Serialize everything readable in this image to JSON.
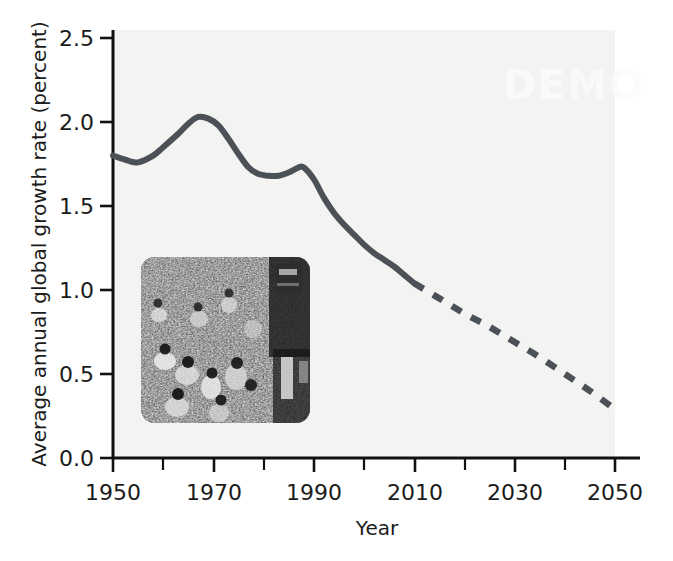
{
  "figure": {
    "background_color": "#ffffff",
    "plot_background_color": "#f3f3f2",
    "line_color": "#4c5057",
    "axis_color": "#111111",
    "watermark_text": "DEMO"
  },
  "inset": {
    "name": "crowd-photograph",
    "description": "Black and white photograph of a dense crowd of people walking in a street",
    "corner_radius_px": 14
  },
  "chart_data": {
    "type": "line",
    "title": "",
    "subtitle": "",
    "xlabel": "Year",
    "ylabel": "Average annual global growth rate (percent)",
    "xlim": [
      1950,
      2050
    ],
    "ylim": [
      0.0,
      2.5
    ],
    "grid": false,
    "legend": "none",
    "x_ticks": [
      1950,
      1960,
      1970,
      1980,
      1990,
      2000,
      2010,
      2020,
      2030,
      2040,
      2050
    ],
    "x_tick_labels": [
      "1950",
      "",
      "1970",
      "",
      "1990",
      "",
      "2010",
      "",
      "2030",
      "",
      "2050"
    ],
    "x_major_labels": [
      "1950",
      "1970",
      "1990",
      "2010",
      "2030",
      "2050"
    ],
    "y_ticks": [
      0.0,
      0.5,
      1.0,
      1.5,
      2.0,
      2.5
    ],
    "y_tick_labels": [
      "0.0",
      "0.5",
      "1.0",
      "1.5",
      "2.0",
      "2.5"
    ],
    "series": [
      {
        "name": "Historical (observed)",
        "style": "solid",
        "x": [
          1950,
          1953,
          1955,
          1958,
          1960,
          1963,
          1965,
          1967,
          1969,
          1971,
          1973,
          1975,
          1977,
          1979,
          1981,
          1983,
          1985,
          1987,
          1988,
          1990,
          1992,
          1994,
          1996,
          1998,
          2000,
          2002,
          2004,
          2006,
          2008,
          2010
        ],
        "y": [
          1.8,
          1.77,
          1.76,
          1.8,
          1.85,
          1.93,
          1.99,
          2.03,
          2.02,
          1.98,
          1.9,
          1.81,
          1.73,
          1.69,
          1.68,
          1.68,
          1.7,
          1.73,
          1.73,
          1.66,
          1.55,
          1.46,
          1.39,
          1.33,
          1.27,
          1.22,
          1.18,
          1.14,
          1.09,
          1.04
        ]
      },
      {
        "name": "Projected",
        "style": "dashed",
        "x": [
          2010,
          2015,
          2020,
          2025,
          2030,
          2035,
          2040,
          2045,
          2050
        ],
        "y": [
          1.04,
          0.95,
          0.86,
          0.78,
          0.69,
          0.6,
          0.5,
          0.4,
          0.29
        ]
      }
    ]
  },
  "axes": {
    "y_axis_name": "y-axis",
    "x_axis_name": "x-axis"
  }
}
